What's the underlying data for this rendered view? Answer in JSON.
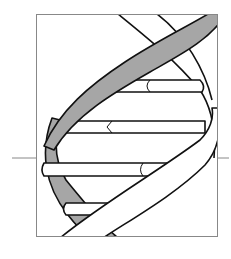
{
  "illustration": {
    "subject": "DNA double helix",
    "colors": {
      "background": "#ffffff",
      "stroke": "#111111",
      "frame": "#888888",
      "shaded_strand": "#a6a6a6",
      "white_strand": "#ffffff"
    },
    "base_pairs_visible": 5
  }
}
